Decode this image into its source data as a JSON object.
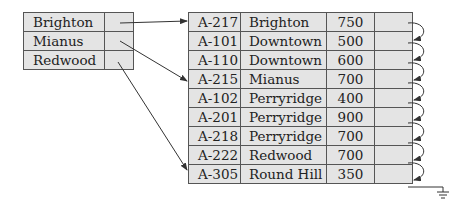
{
  "diagram": {
    "type": "secondary-index",
    "index": {
      "entries": [
        {
          "key": "Brighton",
          "points_to_row": 0
        },
        {
          "key": "Mianus",
          "points_to_row": 3
        },
        {
          "key": "Redwood",
          "points_to_row": 7
        }
      ]
    },
    "file": {
      "columns": [
        "account_number",
        "branch_name",
        "balance",
        "next_pointer"
      ],
      "rows": [
        {
          "account": "A-217",
          "branch": "Brighton",
          "balance": "750"
        },
        {
          "account": "A-101",
          "branch": "Downtown",
          "balance": "500"
        },
        {
          "account": "A-110",
          "branch": "Downtown",
          "balance": "600"
        },
        {
          "account": "A-215",
          "branch": "Mianus",
          "balance": "700"
        },
        {
          "account": "A-102",
          "branch": "Perryridge",
          "balance": "400"
        },
        {
          "account": "A-201",
          "branch": "Perryridge",
          "balance": "900"
        },
        {
          "account": "A-218",
          "branch": "Perryridge",
          "balance": "700"
        },
        {
          "account": "A-222",
          "branch": "Redwood",
          "balance": "700"
        },
        {
          "account": "A-305",
          "branch": "Round Hill",
          "balance": "350"
        }
      ],
      "last_pointer": "null-ground-icon"
    },
    "colors": {
      "cell_fill": "#e4e4e4",
      "border": "#555555",
      "arrow": "#333333"
    }
  }
}
